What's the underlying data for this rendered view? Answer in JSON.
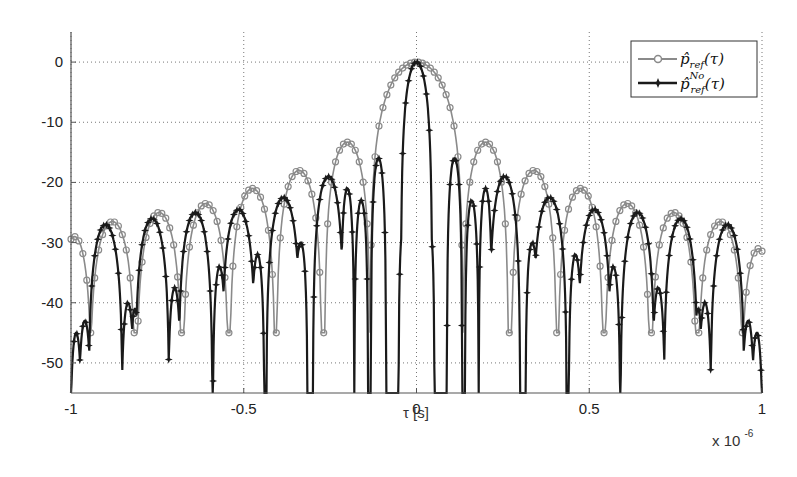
{
  "chart_data": {
    "type": "line",
    "title": "",
    "xlabel": "τ [s]",
    "ylabel": "",
    "x_exponent_label": "x 10",
    "x_exponent_power": "-6",
    "xlim": [
      -1,
      1
    ],
    "ylim": [
      -55,
      5
    ],
    "x_ticks": [
      -1,
      -0.5,
      0,
      0.5,
      1
    ],
    "x_tick_labels": [
      "-1",
      "-0.5",
      "0",
      "0.5",
      "1"
    ],
    "y_ticks": [
      0,
      -10,
      -20,
      -30,
      -40,
      -50
    ],
    "y_tick_labels": [
      "0",
      "-10",
      "-20",
      "-30",
      "-40",
      "-50"
    ],
    "grid": true,
    "legend_position": "upper right",
    "series": [
      {
        "name": "p̂_ref(τ)",
        "legend_main": "p̂",
        "legend_sub": "ref",
        "legend_sup": "",
        "color": "#8a8a8a",
        "marker": "circle-open",
        "null_level": -45,
        "lobes": [
          {
            "center": -0.99,
            "peak": -29,
            "halfwidth": 0.05
          },
          {
            "center": -0.88,
            "peak": -26.5,
            "halfwidth": 0.066
          },
          {
            "center": -0.745,
            "peak": -25,
            "halfwidth": 0.066
          },
          {
            "center": -0.61,
            "peak": -23.5,
            "halfwidth": 0.066
          },
          {
            "center": -0.475,
            "peak": -21,
            "halfwidth": 0.066
          },
          {
            "center": -0.34,
            "peak": -18,
            "halfwidth": 0.066
          },
          {
            "center": -0.2,
            "peak": -13.3,
            "halfwidth": 0.066
          },
          {
            "center": 0.0,
            "peak": 0,
            "halfwidth": 0.134
          },
          {
            "center": 0.2,
            "peak": -13.3,
            "halfwidth": 0.066
          },
          {
            "center": 0.34,
            "peak": -18,
            "halfwidth": 0.066
          },
          {
            "center": 0.475,
            "peak": -21,
            "halfwidth": 0.066
          },
          {
            "center": 0.61,
            "peak": -23.5,
            "halfwidth": 0.066
          },
          {
            "center": 0.745,
            "peak": -25,
            "halfwidth": 0.066
          },
          {
            "center": 0.88,
            "peak": -26.5,
            "halfwidth": 0.066
          },
          {
            "center": 0.99,
            "peak": -31,
            "halfwidth": 0.05
          }
        ]
      },
      {
        "name": "p̂_ref^{No}(τ)",
        "legend_main": "p̂",
        "legend_sub": "ref",
        "legend_sup": "No",
        "color": "#1a1a1a",
        "marker": "star-filled",
        "null_level": -56,
        "lobes": [
          {
            "center": -0.985,
            "peak": -45,
            "halfwidth": 0.018
          },
          {
            "center": -0.96,
            "peak": -43,
            "halfwidth": 0.02
          },
          {
            "center": -0.9,
            "peak": -27,
            "halfwidth": 0.05
          },
          {
            "center": -0.835,
            "peak": -40,
            "halfwidth": 0.02
          },
          {
            "center": -0.815,
            "peak": -41,
            "halfwidth": 0.015
          },
          {
            "center": -0.765,
            "peak": -26,
            "halfwidth": 0.05
          },
          {
            "center": -0.7,
            "peak": -37.5,
            "halfwidth": 0.02
          },
          {
            "center": -0.64,
            "peak": -25,
            "halfwidth": 0.05
          },
          {
            "center": -0.57,
            "peak": -34,
            "halfwidth": 0.02
          },
          {
            "center": -0.515,
            "peak": -24.5,
            "halfwidth": 0.05
          },
          {
            "center": -0.46,
            "peak": -32,
            "halfwidth": 0.02
          },
          {
            "center": -0.385,
            "peak": -22.5,
            "halfwidth": 0.05
          },
          {
            "center": -0.335,
            "peak": -30,
            "halfwidth": 0.02
          },
          {
            "center": -0.255,
            "peak": -19,
            "halfwidth": 0.045
          },
          {
            "center": -0.2,
            "peak": -21,
            "halfwidth": 0.02
          },
          {
            "center": -0.16,
            "peak": -23,
            "halfwidth": 0.02
          },
          {
            "center": -0.11,
            "peak": -16,
            "halfwidth": 0.022
          },
          {
            "center": -0.04,
            "peak": -28,
            "halfwidth": 0.012
          },
          {
            "center": 0.0,
            "peak": 0,
            "halfwidth": 0.045
          },
          {
            "center": 0.04,
            "peak": -28,
            "halfwidth": 0.012
          },
          {
            "center": 0.11,
            "peak": -16,
            "halfwidth": 0.022
          },
          {
            "center": 0.16,
            "peak": -23,
            "halfwidth": 0.02
          },
          {
            "center": 0.2,
            "peak": -21,
            "halfwidth": 0.02
          },
          {
            "center": 0.255,
            "peak": -19,
            "halfwidth": 0.045
          },
          {
            "center": 0.335,
            "peak": -30,
            "halfwidth": 0.02
          },
          {
            "center": 0.385,
            "peak": -22.5,
            "halfwidth": 0.05
          },
          {
            "center": 0.46,
            "peak": -32,
            "halfwidth": 0.02
          },
          {
            "center": 0.515,
            "peak": -24.5,
            "halfwidth": 0.05
          },
          {
            "center": 0.57,
            "peak": -34,
            "halfwidth": 0.02
          },
          {
            "center": 0.64,
            "peak": -25,
            "halfwidth": 0.05
          },
          {
            "center": 0.7,
            "peak": -37.5,
            "halfwidth": 0.02
          },
          {
            "center": 0.765,
            "peak": -26,
            "halfwidth": 0.05
          },
          {
            "center": 0.815,
            "peak": -41,
            "halfwidth": 0.015
          },
          {
            "center": 0.835,
            "peak": -40,
            "halfwidth": 0.02
          },
          {
            "center": 0.9,
            "peak": -27,
            "halfwidth": 0.05
          },
          {
            "center": 0.96,
            "peak": -43,
            "halfwidth": 0.02
          },
          {
            "center": 0.985,
            "peak": -45,
            "halfwidth": 0.018
          }
        ]
      }
    ]
  },
  "layout": {
    "plot_left": 71,
    "plot_right": 762,
    "plot_top": 32,
    "plot_bottom": 393
  }
}
